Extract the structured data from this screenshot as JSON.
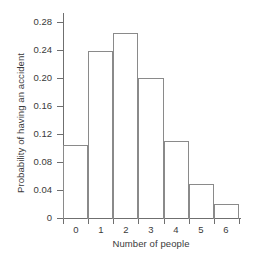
{
  "chart_data": {
    "type": "bar",
    "title": "",
    "xlabel": "Number of people",
    "ylabel": "Probability of having an accident",
    "categories": [
      "0",
      "1",
      "2",
      "3",
      "4",
      "5",
      "6"
    ],
    "values": [
      0.105,
      0.238,
      0.265,
      0.2,
      0.11,
      0.048,
      0.02
    ],
    "xlim": [
      -0.5,
      6.5
    ],
    "ylim": [
      0,
      0.29
    ],
    "xticks": [
      "0",
      "1",
      "2",
      "3",
      "4",
      "5",
      "6"
    ],
    "yticks": [
      "0",
      "0.04",
      "0.08",
      "0.12",
      "0.16",
      "0.20",
      "0.24",
      "0.28"
    ],
    "ytick_values": [
      0,
      0.04,
      0.08,
      0.12,
      0.16,
      0.2,
      0.24,
      0.28
    ],
    "grid": false,
    "legend": null,
    "bar_style": "histogram-outline",
    "colors": {
      "bar_edge": "#8a8a8a",
      "bar_fill": "none",
      "axis": "#6f6f6f",
      "text": "#3a3a3a",
      "background": "#ffffff"
    }
  }
}
